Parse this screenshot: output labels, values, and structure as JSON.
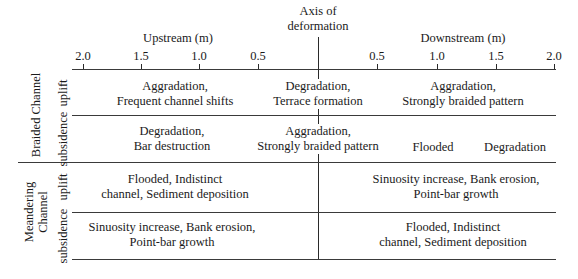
{
  "axis": {
    "center_label_line1": "Axis of",
    "center_label_line2": "deformation",
    "upstream_label": "Upstream (m)",
    "downstream_label": "Downstream (m)",
    "upstream_ticks": [
      "2.0",
      "1.5",
      "1.0",
      "0.5"
    ],
    "downstream_ticks": [
      "0.5",
      "1.0",
      "1.5",
      "2.0"
    ]
  },
  "groups": {
    "braided": "Braided Channel",
    "meandering_line1": "Meandering",
    "meandering_line2": "Channel"
  },
  "row_labels": {
    "uplift": "uplift",
    "subsidence": "subsidence"
  },
  "cells": {
    "braided_uplift": {
      "upstream": [
        "Aggradation,",
        "Frequent channel shifts"
      ],
      "axis": [
        "Degradation,",
        "Terrace formation"
      ],
      "downstream": [
        "Aggradation,",
        "Strongly braided pattern"
      ]
    },
    "braided_subsidence": {
      "upstream": [
        "Degradation,",
        "Bar destruction"
      ],
      "axis": [
        "Aggradation,",
        "Strongly braided pattern"
      ],
      "downstream_near": "Flooded",
      "downstream_far": "Degradation"
    },
    "meandering_uplift": {
      "upstream": [
        "Flooded, Indistinct",
        "channel, Sediment deposition"
      ],
      "downstream": [
        "Sinuosity increase, Bank erosion,",
        "Point-bar growth"
      ]
    },
    "meandering_subsidence": {
      "upstream": [
        "Sinuosity increase, Bank erosion,",
        "Point-bar growth"
      ],
      "downstream": [
        "Flooded, Indistinct",
        "channel, Sediment deposition"
      ]
    }
  }
}
